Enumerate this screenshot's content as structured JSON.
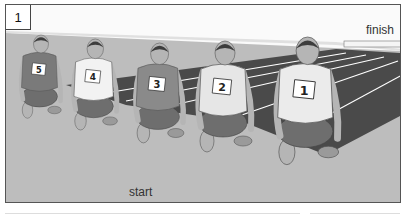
{
  "panel": {
    "number": "1",
    "labels": {
      "finish": "finish",
      "start": "start"
    }
  },
  "runners": [
    {
      "bib": "5",
      "vest_color": "#7a7a7a"
    },
    {
      "bib": "4",
      "vest_color": "#f2f2f2"
    },
    {
      "bib": "3",
      "vest_color": "#8a8a8a"
    },
    {
      "bib": "2",
      "vest_color": "#e6e6e6"
    },
    {
      "bib": "1",
      "vest_color": "#ebebeb"
    }
  ],
  "colors": {
    "ground": "#bdbdbd",
    "track": "#4a4a4a",
    "lane_line": "#ffffff",
    "sky": "#fafafa",
    "skin": "#b5b5b5",
    "shorts": "#6e6e6e"
  }
}
